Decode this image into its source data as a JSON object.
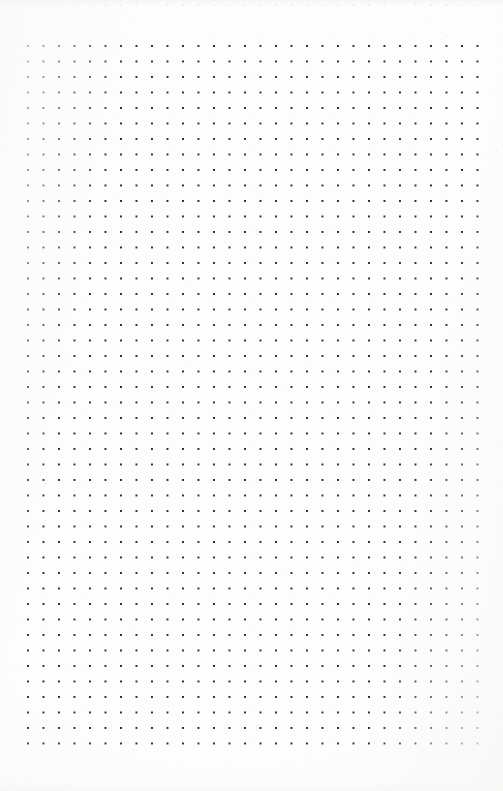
{
  "image": {
    "subject": "dot grid paper",
    "description": "Scanned blank sheet of dot grid (bullet journal) paper",
    "width": 503,
    "height": 791,
    "orientation": "portrait"
  },
  "paper": {
    "background_color": "#fdfdfd",
    "texture": "faint scanner speckle",
    "content_text": "",
    "handwriting": "none",
    "printed_text": "none"
  },
  "grid": {
    "type": "dot-grid",
    "dot_color": "#2b2b2b",
    "dot_size_px": 2,
    "spacing_x_px": 15.5,
    "spacing_y_px": 15.5,
    "origin_x_px": 28,
    "origin_y_px": 46,
    "columns": 30,
    "rows": 46,
    "last_dot_x_px": 473,
    "last_dot_y_px": 753,
    "margin_left_px": 28,
    "margin_right_px": 30,
    "margin_top_px": 46,
    "margin_bottom_px": 38
  },
  "clipped_row": {
    "present": true,
    "description": "partial faint dot row cut off by the top page edge",
    "y_px": 4,
    "opacity": 0.16,
    "color": "#9a9a9a"
  }
}
